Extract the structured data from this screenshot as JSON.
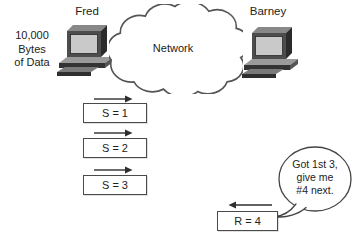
{
  "sender": {
    "name": "Fred",
    "caption_lines": [
      "10,000",
      "Bytes",
      "of Data"
    ]
  },
  "receiver": {
    "name": "Barney"
  },
  "cloud": {
    "label": "Network"
  },
  "segments": [
    {
      "label": "S = 1",
      "direction": "right"
    },
    {
      "label": "S = 2",
      "direction": "right"
    },
    {
      "label": "S = 3",
      "direction": "right"
    }
  ],
  "ack": {
    "label": "R = 4",
    "direction": "left"
  },
  "speech": {
    "lines": [
      "Got 1st 3,",
      "give me",
      "#4 next."
    ]
  },
  "colors": {
    "ink": "#2e2e2e",
    "box_border": "#4a4a4a",
    "monitor_front": "#4d4d4d",
    "screen": "#c9c9c9",
    "base_top": "#9a9a9a",
    "background": "#ffffff"
  }
}
